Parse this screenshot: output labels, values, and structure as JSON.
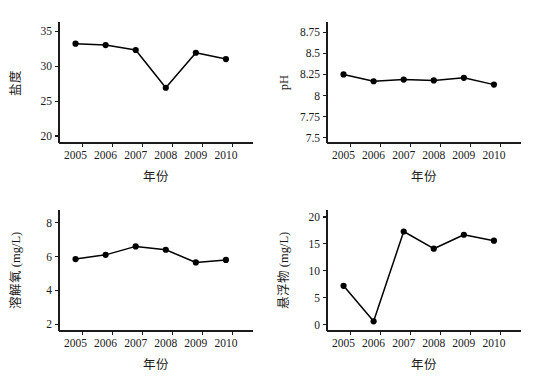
{
  "figure": {
    "background_color": "#ffffff",
    "line_color": "#000000",
    "marker_color": "#000000",
    "axis_color": "#1b1b1b",
    "layout": "2x2 grid of line charts"
  },
  "chart_data": [
    {
      "id": "salinity",
      "type": "line",
      "title": "",
      "xlabel": "年份",
      "ylabel": "盐度",
      "categories": [
        "2005",
        "2006",
        "2007",
        "2008",
        "2009",
        "2010"
      ],
      "x": [
        2005,
        2006,
        2007,
        2008,
        2009,
        2010
      ],
      "values": [
        33.2,
        33.0,
        32.3,
        26.9,
        31.9,
        31.0
      ],
      "yticks": [
        "20",
        "25",
        "30",
        "35"
      ],
      "ytick_values": [
        20,
        25,
        30,
        35
      ],
      "xticks": [
        "2005",
        "2006",
        "2007",
        "2008",
        "2009",
        "2010"
      ],
      "ylim": [
        19.0,
        36.3
      ],
      "xlim": [
        2004.45,
        2010.9
      ],
      "grid": false,
      "legend": false,
      "marker": "filled-circle"
    },
    {
      "id": "ph",
      "type": "line",
      "title": "",
      "xlabel": "年份",
      "ylabel": "pH",
      "categories": [
        "2005",
        "2006",
        "2007",
        "2008",
        "2009",
        "2010"
      ],
      "x": [
        2005,
        2006,
        2007,
        2008,
        2009,
        2010
      ],
      "values": [
        8.25,
        8.17,
        8.19,
        8.18,
        8.21,
        8.13
      ],
      "yticks": [
        "7.5",
        "7.75",
        "8",
        "8.25",
        "8.5",
        "8.75"
      ],
      "ytick_values": [
        7.5,
        7.75,
        8.0,
        8.25,
        8.5,
        8.75
      ],
      "xticks": [
        "2005",
        "2006",
        "2007",
        "2008",
        "2009",
        "2010"
      ],
      "ylim": [
        7.44,
        8.87
      ],
      "xlim": [
        2004.45,
        2010.9
      ],
      "grid": false,
      "legend": false,
      "marker": "filled-circle"
    },
    {
      "id": "dissolved-oxygen",
      "type": "line",
      "title": "",
      "xlabel": "年份",
      "ylabel": "溶解氧 (mg/L)",
      "categories": [
        "2005",
        "2006",
        "2007",
        "2008",
        "2009",
        "2010"
      ],
      "x": [
        2005,
        2006,
        2007,
        2008,
        2009,
        2010
      ],
      "values": [
        5.85,
        6.1,
        6.6,
        6.4,
        5.65,
        5.8
      ],
      "yticks": [
        "2",
        "4",
        "6",
        "8"
      ],
      "ytick_values": [
        2,
        4,
        6,
        8
      ],
      "xticks": [
        "2005",
        "2006",
        "2007",
        "2008",
        "2009",
        "2010"
      ],
      "ylim": [
        1.6,
        8.75
      ],
      "xlim": [
        2004.45,
        2010.9
      ],
      "grid": false,
      "legend": false,
      "marker": "filled-circle"
    },
    {
      "id": "suspended-solids",
      "type": "line",
      "title": "",
      "xlabel": "年份",
      "ylabel": "悬浮物 (mg/L)",
      "categories": [
        "2005",
        "2006",
        "2007",
        "2008",
        "2009",
        "2010"
      ],
      "x": [
        2005,
        2006,
        2007,
        2008,
        2009,
        2010
      ],
      "values": [
        7.2,
        0.6,
        17.3,
        14.1,
        16.7,
        15.6
      ],
      "yticks": [
        "0",
        "5",
        "10",
        "15",
        "20"
      ],
      "ytick_values": [
        0,
        5,
        10,
        15,
        20
      ],
      "xticks": [
        "2005",
        "2006",
        "2007",
        "2008",
        "2009",
        "2010"
      ],
      "ylim": [
        -1.2,
        21.3
      ],
      "xlim": [
        2004.45,
        2010.9
      ],
      "grid": false,
      "legend": false,
      "marker": "filled-circle"
    }
  ]
}
